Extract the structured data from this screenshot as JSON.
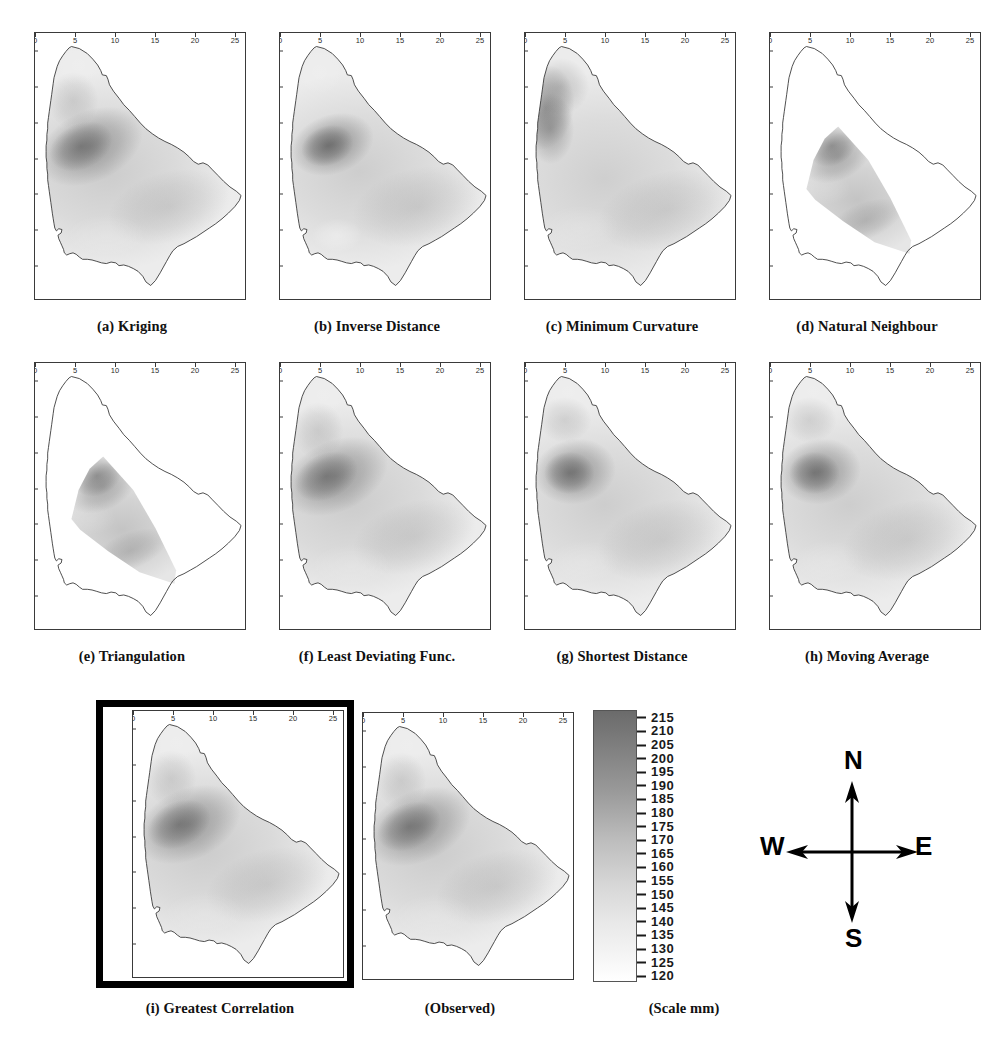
{
  "figure": {
    "panel_rows": 3,
    "panel_cols": 4
  },
  "axes": {
    "x_ticks": [
      "0",
      "5",
      "10",
      "15",
      "20",
      "25"
    ],
    "y_ticks": [
      "0",
      "5",
      "10",
      "15",
      "20",
      "25",
      "30",
      "35"
    ],
    "x_range": [
      0,
      26.5
    ],
    "y_range": [
      0,
      37.5
    ]
  },
  "panels": [
    {
      "id": "a",
      "caption": "(a) Kriging",
      "method": "Kriging",
      "field": "smooth-full",
      "highlight": false
    },
    {
      "id": "b",
      "caption": "(b) Inverse Distance",
      "method": "Inverse Distance",
      "field": "bullseye-full",
      "highlight": false
    },
    {
      "id": "c",
      "caption": "(c) Minimum Curvature",
      "method": "Minimum Curvature",
      "field": "westcoast-full",
      "highlight": false
    },
    {
      "id": "d",
      "caption": "(d) Natural Neighbour",
      "method": "Natural Neighbour",
      "field": "hull-only",
      "highlight": false
    },
    {
      "id": "e",
      "caption": "(e) Triangulation",
      "method": "Triangulation",
      "field": "hull-only",
      "highlight": false
    },
    {
      "id": "f",
      "caption": "(f) Least Deviating Func.",
      "method": "Least Deviating Func.",
      "field": "smooth-full",
      "highlight": false
    },
    {
      "id": "g",
      "caption": "(g) Shortest Distance",
      "method": "Shortest Distance",
      "field": "blob-full",
      "highlight": false
    },
    {
      "id": "h",
      "caption": "(h) Moving Average",
      "method": "Moving Average",
      "field": "blob-full",
      "highlight": false
    },
    {
      "id": "i",
      "caption": "(i) Greatest Correlation",
      "method": "Greatest Correlation",
      "field": "smooth-full",
      "highlight": true
    },
    {
      "id": "obs",
      "caption": "(Observed)",
      "method": "Observed",
      "field": "smooth-full",
      "highlight": false
    }
  ],
  "colorbar": {
    "caption": "(Scale mm)",
    "units": "mm",
    "min": 120,
    "max": 215,
    "step": 5,
    "ticks": [
      "215",
      "210",
      "205",
      "200",
      "195",
      "190",
      "185",
      "180",
      "175",
      "170",
      "165",
      "160",
      "155",
      "150",
      "145",
      "140",
      "135",
      "130",
      "125",
      "120"
    ],
    "high_color": "#6b6b6b",
    "low_color": "#ffffff"
  },
  "compass": {
    "north": "N",
    "south": "S",
    "east": "E",
    "west": "W"
  },
  "chart_data": {
    "type": "heatmap",
    "xlabel": "",
    "ylabel": "",
    "xlim": [
      0,
      26.5
    ],
    "ylim": [
      0,
      37.5
    ],
    "grid": false,
    "legend": "colorbar-right",
    "colorbar": {
      "label": "(Scale mm)",
      "min": 120,
      "max": 215,
      "step": 5,
      "tick_values": [
        215,
        210,
        205,
        200,
        195,
        190,
        185,
        180,
        175,
        170,
        165,
        160,
        155,
        150,
        145,
        140,
        135,
        130,
        125,
        120
      ],
      "ramp": "white-to-grey (low to high)"
    },
    "panels": [
      {
        "label": "(a) Kriging",
        "max_value": 215,
        "min_value": 120,
        "peak_xy": [
          6.5,
          21.5
        ],
        "coverage": "whole island",
        "notes": "Broad smooth high-rainfall core on the west-central side; gradual falloff south and east."
      },
      {
        "label": "(b) Inverse Distance",
        "max_value": 215,
        "min_value": 120,
        "peak_xy": [
          6.0,
          21.5
        ],
        "coverage": "whole island",
        "notes": "Compact dark bullseye west-centre; pronounced white low near (7,9) in the southwest."
      },
      {
        "label": "(c) Minimum Curvature",
        "max_value": 215,
        "min_value": 120,
        "peak_xy": [
          2.5,
          27.0
        ],
        "coverage": "whole island",
        "notes": "Darkest band hugs the northwest coastline; smooth broad decline toward the southeast."
      },
      {
        "label": "(d) Natural Neighbour",
        "max_value": 215,
        "min_value": 120,
        "peak_xy": [
          7.5,
          22.0
        ],
        "coverage": "convex hull of data points only",
        "notes": "Interpolated values confined to the convex hull; rest of island left blank/white."
      },
      {
        "label": "(e) Triangulation",
        "max_value": 215,
        "min_value": 120,
        "peak_xy": [
          7.5,
          21.5
        ],
        "coverage": "convex hull of data points only",
        "notes": "Triangular facetted surface restricted to the data hull; sharp straight hull edges."
      },
      {
        "label": "(f) Least Deviating Func.",
        "max_value": 215,
        "min_value": 120,
        "peak_xy": [
          5.5,
          22.0
        ],
        "coverage": "whole island",
        "notes": "Elongated dark ridge running NNE-SSW along the west-central interior."
      },
      {
        "label": "(g) Shortest Distance",
        "max_value": 215,
        "min_value": 120,
        "peak_xy": [
          6.0,
          22.0
        ],
        "coverage": "whole island",
        "notes": "Rounded dark core slightly north of centre-west with lighter north-coast fringe."
      },
      {
        "label": "(h) Moving Average",
        "max_value": 215,
        "min_value": 120,
        "peak_xy": [
          6.5,
          22.0
        ],
        "coverage": "whole island",
        "notes": "Very smooth oval maximum west-centre; broad low in the far south."
      },
      {
        "label": "(i) Greatest Correlation",
        "max_value": 215,
        "min_value": 120,
        "peak_xy": [
          6.0,
          21.5
        ],
        "coverage": "whole island",
        "notes": "Selected as best match to observed; highlighted with heavy black border."
      },
      {
        "label": "(Observed)",
        "max_value": 215,
        "min_value": 120,
        "peak_xy": [
          6.0,
          21.0
        ],
        "coverage": "whole island",
        "notes": "Observed rainfall surface used as the reference for comparison."
      }
    ]
  }
}
